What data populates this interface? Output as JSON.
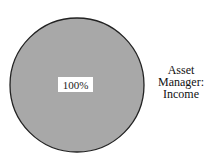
{
  "chart_data": {
    "type": "pie",
    "title": "",
    "slices": [
      {
        "label": "Asset Manager: Income",
        "value": 100,
        "color": "#a8a8a8",
        "data_label": "100%"
      }
    ],
    "legend_lines": [
      "Asset",
      "Manager:",
      "Income"
    ],
    "legend_position": "right"
  }
}
